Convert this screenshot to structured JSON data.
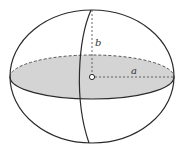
{
  "diagram": {
    "type": "ellipsoid",
    "labels": {
      "semi_axis_vertical": "b",
      "semi_axis_horizontal": "a"
    },
    "colors": {
      "stroke": "#2a2a2a",
      "fill_equator": "#d4d4d4",
      "dashed": "#555555",
      "background": "#ffffff"
    }
  }
}
